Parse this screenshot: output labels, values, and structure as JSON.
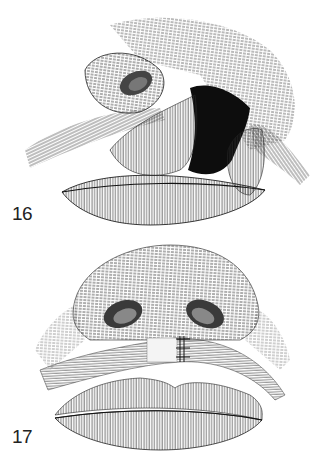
{
  "figures": [
    {
      "number": "16",
      "subject": "nose-and-lip-with-retracted-muscle-flaps-exposing-cleft-cavity"
    },
    {
      "number": "17",
      "subject": "nose-and-lip-with-muscle-sutured-across-midline"
    }
  ],
  "colors": {
    "ink": "#1a1a1a",
    "background": "#ffffff"
  }
}
